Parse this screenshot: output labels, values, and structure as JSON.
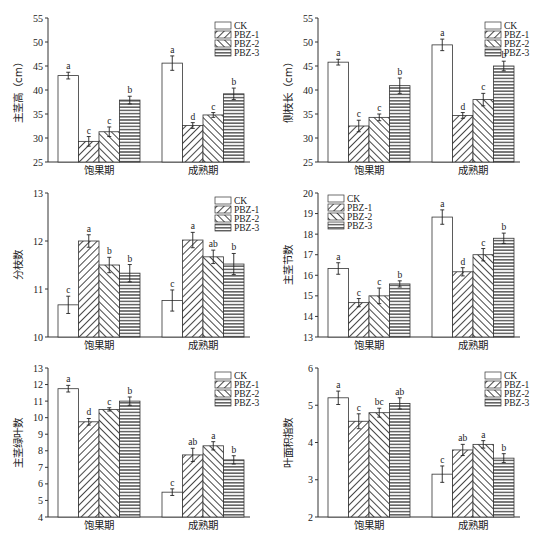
{
  "groups": [
    "饱果期",
    "成熟期"
  ],
  "legend": [
    "CK",
    "PBZ-1",
    "PBZ-2",
    "PBZ-3"
  ],
  "chart_data": [
    {
      "type": "bar",
      "ylabel": "主茎高（cm）",
      "ylim": [
        25,
        55
      ],
      "yticks": [
        25,
        30,
        35,
        40,
        45,
        50,
        55
      ],
      "categories": [
        "饱果期",
        "成熟期"
      ],
      "legend_position": "top-right",
      "series": [
        {
          "name": "CK",
          "values": [
            43.0,
            45.6
          ],
          "errors": [
            0.7,
            1.5
          ],
          "letters": [
            "a",
            "a"
          ]
        },
        {
          "name": "PBZ-1",
          "values": [
            29.3,
            32.6
          ],
          "errors": [
            1.0,
            0.6
          ],
          "letters": [
            "c",
            "d"
          ]
        },
        {
          "name": "PBZ-2",
          "values": [
            31.3,
            34.8
          ],
          "errors": [
            1.0,
            0.5
          ],
          "letters": [
            "c",
            "c"
          ]
        },
        {
          "name": "PBZ-3",
          "values": [
            37.9,
            39.2
          ],
          "errors": [
            0.8,
            1.2
          ],
          "letters": [
            "b",
            "b"
          ]
        }
      ]
    },
    {
      "type": "bar",
      "ylabel": "侧枝长（cm）",
      "ylim": [
        25,
        55
      ],
      "yticks": [
        25,
        30,
        35,
        40,
        45,
        50,
        55
      ],
      "categories": [
        "饱果期",
        "成熟期"
      ],
      "legend_position": "top-right",
      "series": [
        {
          "name": "CK",
          "values": [
            45.8,
            49.4
          ],
          "errors": [
            0.6,
            1.2
          ],
          "letters": [
            "a",
            "a"
          ]
        },
        {
          "name": "PBZ-1",
          "values": [
            32.5,
            34.7
          ],
          "errors": [
            1.2,
            0.6
          ],
          "letters": [
            "c",
            "d"
          ]
        },
        {
          "name": "PBZ-2",
          "values": [
            34.3,
            38.0
          ],
          "errors": [
            0.7,
            1.3
          ],
          "letters": [
            "c",
            "c"
          ]
        },
        {
          "name": "PBZ-3",
          "values": [
            40.9,
            45.0
          ],
          "errors": [
            1.6,
            1.0
          ],
          "letters": [
            "b",
            "b"
          ]
        }
      ]
    },
    {
      "type": "bar",
      "ylabel": "分枝数",
      "ylim": [
        10,
        13
      ],
      "yticks": [
        10,
        11,
        12,
        13
      ],
      "categories": [
        "饱果期",
        "成熟期"
      ],
      "legend_position": "top-right",
      "series": [
        {
          "name": "CK",
          "values": [
            10.67,
            10.76
          ],
          "errors": [
            0.18,
            0.22
          ],
          "letters": [
            "c",
            "c"
          ]
        },
        {
          "name": "PBZ-1",
          "values": [
            12.0,
            12.02
          ],
          "errors": [
            0.13,
            0.16
          ],
          "letters": [
            "a",
            "a"
          ]
        },
        {
          "name": "PBZ-2",
          "values": [
            11.5,
            11.67
          ],
          "errors": [
            0.16,
            0.14
          ],
          "letters": [
            "b",
            "ab"
          ]
        },
        {
          "name": "PBZ-3",
          "values": [
            11.33,
            11.52
          ],
          "errors": [
            0.18,
            0.22
          ],
          "letters": [
            "b",
            "b"
          ]
        }
      ]
    },
    {
      "type": "bar",
      "ylabel": "主茎节数",
      "ylim": [
        13,
        20
      ],
      "yticks": [
        13,
        14,
        15,
        16,
        17,
        18,
        19,
        20
      ],
      "categories": [
        "饱果期",
        "成熟期"
      ],
      "legend_position": "top-left",
      "series": [
        {
          "name": "CK",
          "values": [
            16.33,
            18.83
          ],
          "errors": [
            0.28,
            0.35
          ],
          "letters": [
            "a",
            "a"
          ]
        },
        {
          "name": "PBZ-1",
          "values": [
            14.67,
            16.17
          ],
          "errors": [
            0.2,
            0.2
          ],
          "letters": [
            "c",
            "d"
          ]
        },
        {
          "name": "PBZ-2",
          "values": [
            15.0,
            17.0
          ],
          "errors": [
            0.38,
            0.3
          ],
          "letters": [
            "c",
            "c"
          ]
        },
        {
          "name": "PBZ-3",
          "values": [
            15.58,
            17.8
          ],
          "errors": [
            0.15,
            0.25
          ],
          "letters": [
            "b",
            "b"
          ]
        }
      ]
    },
    {
      "type": "bar",
      "ylabel": "主茎绿叶数",
      "ylim": [
        4,
        13
      ],
      "yticks": [
        4,
        5,
        6,
        7,
        8,
        9,
        10,
        11,
        12,
        13
      ],
      "categories": [
        "饱果期",
        "成熟期"
      ],
      "legend_position": "top-right",
      "series": [
        {
          "name": "CK",
          "values": [
            11.75,
            5.5
          ],
          "errors": [
            0.2,
            0.2
          ],
          "letters": [
            "a",
            "c"
          ]
        },
        {
          "name": "PBZ-1",
          "values": [
            9.75,
            7.75
          ],
          "errors": [
            0.2,
            0.4
          ],
          "letters": [
            "d",
            "ab"
          ]
        },
        {
          "name": "PBZ-2",
          "values": [
            10.5,
            8.3
          ],
          "errors": [
            0.1,
            0.25
          ],
          "letters": [
            "c",
            "a"
          ]
        },
        {
          "name": "PBZ-3",
          "values": [
            11.0,
            7.45
          ],
          "errors": [
            0.25,
            0.25
          ],
          "letters": [
            "b",
            "b"
          ]
        }
      ]
    },
    {
      "type": "bar",
      "ylabel": "叶面积指数",
      "ylim": [
        2,
        6
      ],
      "yticks": [
        2,
        3,
        4,
        5,
        6
      ],
      "categories": [
        "饱果期",
        "成熟期"
      ],
      "legend_position": "top-right",
      "series": [
        {
          "name": "CK",
          "values": [
            5.2,
            3.15
          ],
          "errors": [
            0.18,
            0.22
          ],
          "letters": [
            "a",
            "c"
          ]
        },
        {
          "name": "PBZ-1",
          "values": [
            4.57,
            3.8
          ],
          "errors": [
            0.2,
            0.15
          ],
          "letters": [
            "c",
            "ab"
          ]
        },
        {
          "name": "PBZ-2",
          "values": [
            4.8,
            3.95
          ],
          "errors": [
            0.12,
            0.1
          ],
          "letters": [
            "bc",
            "a"
          ]
        },
        {
          "name": "PBZ-3",
          "values": [
            5.05,
            3.58
          ],
          "errors": [
            0.15,
            0.12
          ],
          "letters": [
            "ab",
            "b"
          ]
        }
      ]
    }
  ]
}
